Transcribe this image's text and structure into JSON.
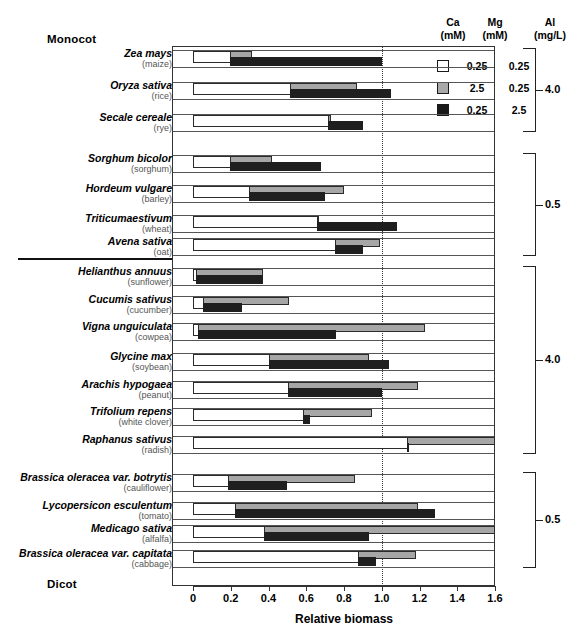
{
  "figure": {
    "group_label_top": "Monocot",
    "group_label_bottom": "Dicot",
    "divider": true
  },
  "legend": {
    "header_ca": "Ca\n(mM)",
    "header_ca_line1": "Ca",
    "header_ca_line2": "(mM)",
    "header_mg_line1": "Mg",
    "header_mg_line2": "(mM)",
    "header_al_line1": "Al",
    "header_al_line2": "(mg/L)",
    "entries": [
      {
        "swatch": "white",
        "ca": "0.25",
        "mg": "0.25"
      },
      {
        "swatch": "gray",
        "ca": "2.5",
        "mg": "0.25"
      },
      {
        "swatch": "black",
        "ca": "0.25",
        "mg": "2.5"
      }
    ]
  },
  "brackets": [
    {
      "label": "4.0"
    },
    {
      "label": "0.5"
    },
    {
      "label": "4.0"
    },
    {
      "label": "0.5"
    }
  ],
  "chart_data": {
    "type": "bar",
    "orientation": "horizontal",
    "title": "",
    "xlabel": "Relative biomass",
    "ylabel": "",
    "xlim": [
      0,
      1.6
    ],
    "xticks": [
      0,
      0.2,
      0.4,
      0.6,
      0.8,
      1.0,
      1.2,
      1.4,
      1.6
    ],
    "xticklabels": [
      "0",
      "0.2",
      "0.4",
      "0.6",
      "0.8",
      "1.0",
      "1.2",
      "1.4",
      "1.6"
    ],
    "grid": false,
    "reference_line": 1.0,
    "legend_position": "top-right",
    "series": [
      {
        "name": "Ca 0.25 mM / Mg 0.25 mM",
        "color": "#ffffff",
        "swatch": "white"
      },
      {
        "name": "Ca 2.5 mM / Mg 0.25 mM",
        "color": "#a6a6a6",
        "swatch": "gray"
      },
      {
        "name": "Ca 0.25 mM / Mg 2.5 mM",
        "color": "#1f1f1f",
        "swatch": "black"
      }
    ],
    "groups": [
      {
        "class": "Monocot",
        "al": "4.0",
        "categories": [
          {
            "species": "Zea mays",
            "common": "(maize)",
            "values": [
              0.2,
              0.31,
              1.0
            ]
          },
          {
            "species": "Oryza sativa",
            "common": "(rice)",
            "values": [
              0.52,
              0.87,
              1.05
            ]
          },
          {
            "species": "Secale cereale",
            "common": "(rye)",
            "values": [
              0.72,
              0.73,
              0.9
            ]
          }
        ]
      },
      {
        "class": "Monocot",
        "al": "0.5",
        "categories": [
          {
            "species": "Sorghum bicolor",
            "common": "(sorghum)",
            "values": [
              0.2,
              0.42,
              0.68
            ]
          },
          {
            "species": "Hordeum vulgare",
            "common": "(barley)",
            "values": [
              0.3,
              0.8,
              0.7
            ]
          },
          {
            "species": "Triticumaestivum",
            "common": "(wheat)",
            "values": [
              0.66,
              0.67,
              1.08
            ]
          },
          {
            "species": "Avena sativa",
            "common": "(oat)",
            "values": [
              0.76,
              0.99,
              0.9
            ]
          }
        ]
      },
      {
        "class": "Dicot",
        "al": "4.0",
        "categories": [
          {
            "species": "Helianthus annuus",
            "common": "(sunflower)",
            "values": [
              0.02,
              0.37,
              0.37
            ]
          },
          {
            "species": "Cucumis sativus",
            "common": "(cucumber)",
            "values": [
              0.06,
              0.51,
              0.26
            ]
          },
          {
            "species": "Vigna unguiculata",
            "common": "(cowpea)",
            "values": [
              0.03,
              1.23,
              0.76
            ]
          },
          {
            "species": "Glycine max",
            "common": "(soybean)",
            "values": [
              0.41,
              0.93,
              1.04
            ]
          },
          {
            "species": "Arachis hypogaea",
            "common": "(peanut)",
            "values": [
              0.51,
              1.19,
              1.0
            ]
          },
          {
            "species": "Trifolium repens",
            "common": "(white clover)",
            "values": [
              0.59,
              0.95,
              0.62
            ]
          },
          {
            "species": "Raphanus sativus",
            "common": "(radish)",
            "values": [
              1.14,
              1.6,
              0.84
            ]
          }
        ]
      },
      {
        "class": "Dicot",
        "al": "0.5",
        "categories": [
          {
            "species": "Brassica oleracea var. botrytis",
            "common": "(cauliflower)",
            "values": [
              0.19,
              0.86,
              0.5
            ]
          },
          {
            "species": "Lycopersicon esculentum",
            "common": "(tomato)",
            "values": [
              0.23,
              1.19,
              1.28
            ]
          },
          {
            "species": "Medicago sativa",
            "common": "(alfalfa)",
            "values": [
              0.38,
              1.6,
              0.93
            ]
          },
          {
            "species": "Brassica oleracea var. capitata",
            "common": "(cabbage)",
            "values": [
              0.88,
              1.18,
              0.97
            ]
          }
        ]
      }
    ]
  }
}
